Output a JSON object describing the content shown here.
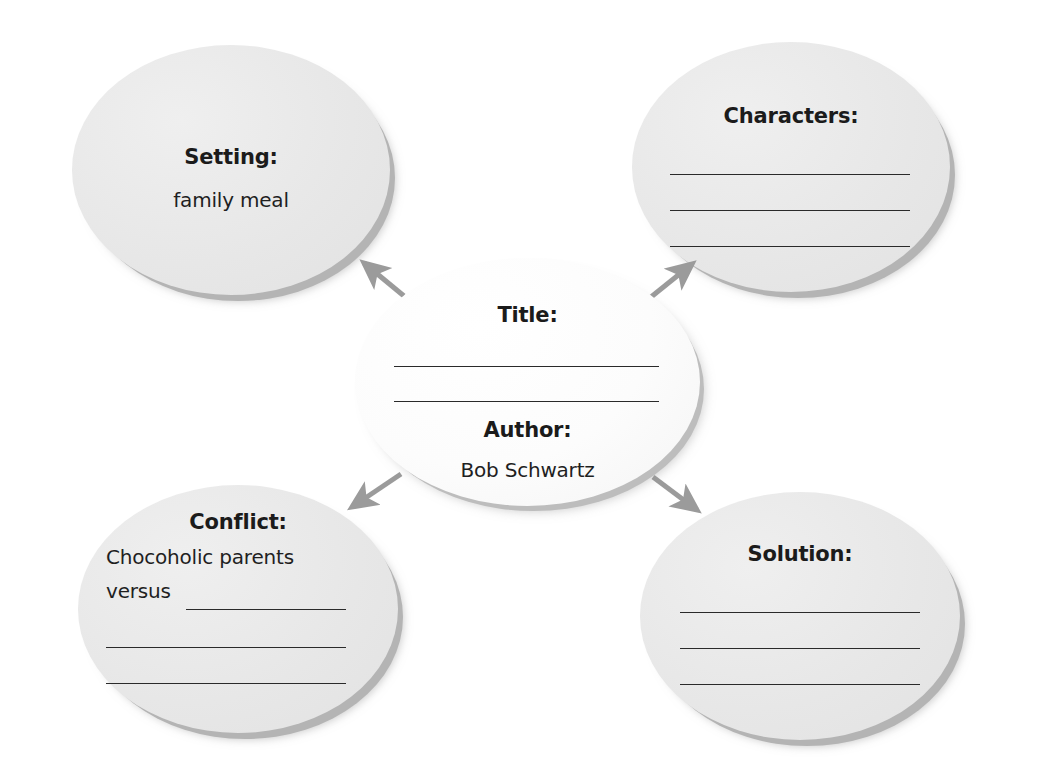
{
  "page": {
    "background_color": "#ffffff",
    "bubble_fill_color": "#e9e9e9",
    "center_bubble_fill_color": "#fbfbfb",
    "shadow_color": "#b4b4b4",
    "text_color": "#1b1b1b",
    "rule_color": "#2a2a2a",
    "arrow_color": "#9b9b9b"
  },
  "bubbles": {
    "setting": {
      "heading": "Setting:",
      "value": "family meal",
      "blank_lines": 0
    },
    "characters": {
      "heading": "Characters:",
      "value": "",
      "blank_lines": 3
    },
    "title": {
      "heading": "Title:",
      "value": "",
      "blank_lines": 2,
      "author_heading": "Author:",
      "author_value": "Bob Schwartz"
    },
    "conflict": {
      "heading": "Conflict:",
      "line1": "Chocoholic parents",
      "line2": "versus",
      "blank_lines": 3
    },
    "solution": {
      "heading": "Solution:",
      "value": "",
      "blank_lines": 3
    }
  },
  "arrows": [
    {
      "name": "arrow-title-to-setting",
      "from": "title",
      "to": "setting"
    },
    {
      "name": "arrow-title-to-characters",
      "from": "title",
      "to": "characters"
    },
    {
      "name": "arrow-title-to-conflict",
      "from": "title",
      "to": "conflict"
    },
    {
      "name": "arrow-title-to-solution",
      "from": "title",
      "to": "solution"
    }
  ]
}
